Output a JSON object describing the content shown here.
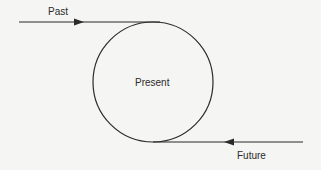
{
  "diagram": {
    "labels": {
      "past": "Past",
      "present": "Present",
      "future": "Future"
    },
    "colors": {
      "stroke": "#2b2b2b",
      "background": "#f5f5f3"
    }
  }
}
